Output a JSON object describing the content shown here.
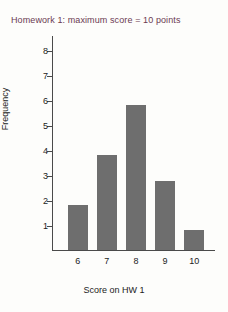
{
  "chart_data": {
    "type": "bar",
    "title": "Homework 1: maximum score = 10 points",
    "xlabel": "Score on HW 1",
    "ylabel": "Frequency",
    "categories": [
      "6",
      "7",
      "8",
      "9",
      "10"
    ],
    "values": [
      1.8,
      3.8,
      5.8,
      2.75,
      0.8
    ],
    "ylim": [
      0,
      8.6
    ],
    "yticks": [
      "8",
      "7",
      "6",
      "5",
      "4",
      "3",
      "2",
      "1"
    ],
    "ytick_values": [
      8,
      7,
      6,
      5,
      4,
      3,
      2,
      1
    ],
    "grid": false,
    "legend": "none",
    "bar_color": "#6e6e6e",
    "axis_color": "#4a4a4a",
    "title_color": "#6b3a52",
    "background_color": "#fdfdfb"
  }
}
